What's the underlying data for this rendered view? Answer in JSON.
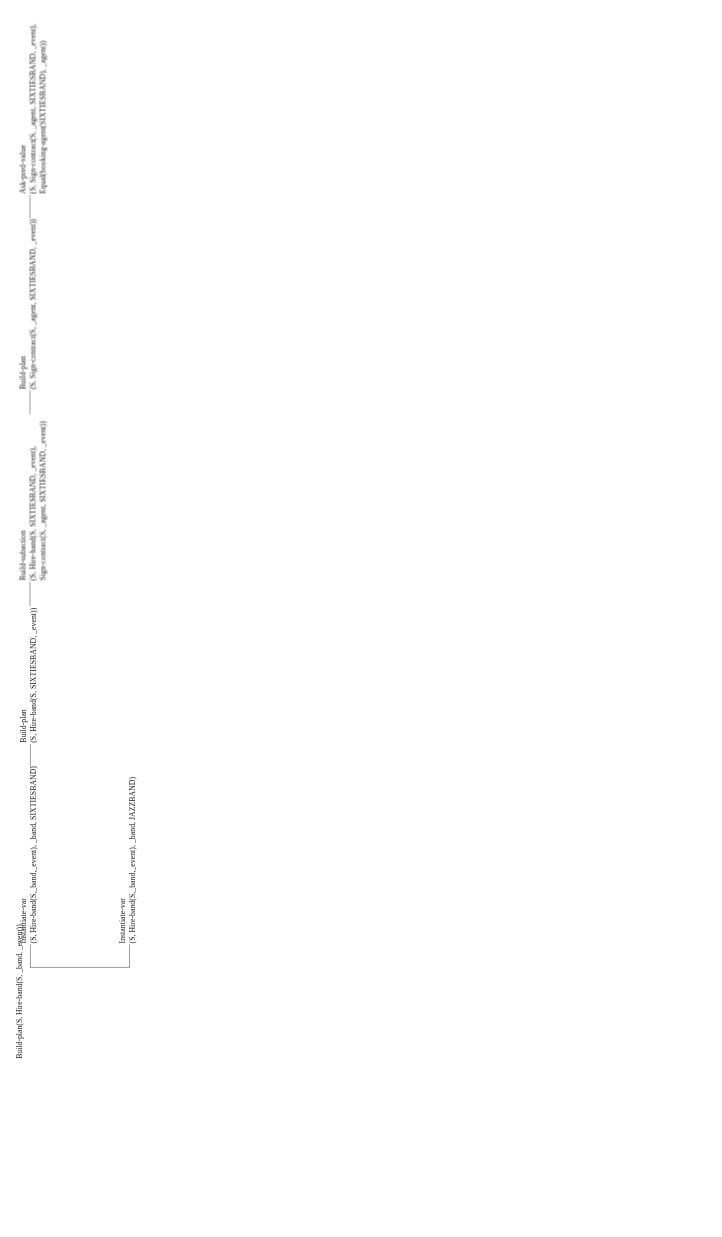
{
  "figure": {
    "kind": "derivation-tree",
    "orientation": "rotated-90-ccw",
    "line_color": "#3b3b3b",
    "text_color": "#1a1a1a",
    "background_color": "#ffffff"
  },
  "root": {
    "expr": "Build-plan(S, Hire-band(S, _band, _event))"
  },
  "nodes": [
    {
      "id": "instantiate-var-jazzband",
      "title": "Instantiate-var",
      "lines": [
        "(S, Hire-band(S,_band,_event), _band, JAZZBAND)"
      ]
    },
    {
      "id": "instantiate-var-sixtiesband",
      "title": "Instantiate-var",
      "lines": [
        "(S, Hire-band(S,_band,_event), _band, SIXTIESBAND)"
      ]
    },
    {
      "id": "build-plan-hire-band",
      "title": "Build-plan",
      "lines": [
        "(S, Hire-band(S, SIXTIESBAND, _event))"
      ]
    },
    {
      "id": "build-subaction-sign-contract",
      "title": "Build-subaction",
      "lines": [
        "(S, Hire-band(S, SIXTIESBAND, _event),",
        "Sign-contract(S, _agent, SIXTIESBAND, _event))"
      ]
    },
    {
      "id": "build-plan-sign-contract",
      "title": "Build-plan",
      "lines": [
        "(S, Sign-contract(S, _agent, SIXTIESBAND, _event))"
      ]
    },
    {
      "id": "ask-pred-value-equal",
      "title": "Ask-pred-value",
      "lines": [
        "(S, Sign-contract(S, _agent, SIXTIESBAND, _event),",
        "Equal(booking-agent(SIXTIESBAND), _agent))"
      ]
    }
  ]
}
